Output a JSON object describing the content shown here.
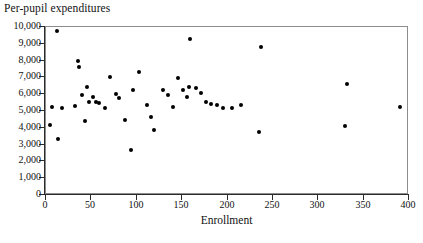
{
  "chart_data": {
    "type": "scatter",
    "title": "Per-pupil expenditures",
    "xlabel": "Enrollment",
    "ylabel": "",
    "xlim": [
      0,
      400
    ],
    "ylim": [
      0,
      10000
    ],
    "xticks": [
      0,
      50,
      100,
      150,
      200,
      250,
      300,
      350,
      400
    ],
    "xtick_labels": [
      "0",
      "50",
      "100",
      "150",
      "200",
      "250",
      "300",
      "350",
      "400"
    ],
    "yticks": [
      0,
      1000,
      2000,
      3000,
      4000,
      5000,
      6000,
      7000,
      8000,
      9000,
      10000
    ],
    "ytick_labels": [
      "0",
      "1,000",
      "2,000",
      "3,000",
      "4,000",
      "5,000",
      "6,000",
      "7,000",
      "8,000",
      "9,000",
      "10,000"
    ],
    "grid": false,
    "legend": null,
    "marker_color": "#000000",
    "marker_shape": "circle",
    "frame_color": "#8d8d8d",
    "background": "#ffffff",
    "n_points": 47,
    "points": [
      {
        "x": 13,
        "y": 9700
      },
      {
        "x": 8,
        "y": 5200
      },
      {
        "x": 6,
        "y": 4100
      },
      {
        "x": 19,
        "y": 5150
      },
      {
        "x": 14,
        "y": 3250
      },
      {
        "x": 36,
        "y": 7900
      },
      {
        "x": 37,
        "y": 7550
      },
      {
        "x": 41,
        "y": 5900
      },
      {
        "x": 33,
        "y": 5250
      },
      {
        "x": 46,
        "y": 6400
      },
      {
        "x": 48,
        "y": 5500
      },
      {
        "x": 44,
        "y": 4350
      },
      {
        "x": 53,
        "y": 5800
      },
      {
        "x": 56,
        "y": 5500
      },
      {
        "x": 60,
        "y": 5400
      },
      {
        "x": 66,
        "y": 5150
      },
      {
        "x": 72,
        "y": 6950
      },
      {
        "x": 78,
        "y": 5950
      },
      {
        "x": 82,
        "y": 5700
      },
      {
        "x": 88,
        "y": 4400
      },
      {
        "x": 95,
        "y": 2600
      },
      {
        "x": 97,
        "y": 6200
      },
      {
        "x": 104,
        "y": 7250
      },
      {
        "x": 112,
        "y": 5300
      },
      {
        "x": 117,
        "y": 4600
      },
      {
        "x": 120,
        "y": 3800
      },
      {
        "x": 130,
        "y": 6200
      },
      {
        "x": 136,
        "y": 5900
      },
      {
        "x": 141,
        "y": 5200
      },
      {
        "x": 147,
        "y": 6900
      },
      {
        "x": 152,
        "y": 6200
      },
      {
        "x": 156,
        "y": 5800
      },
      {
        "x": 160,
        "y": 9250
      },
      {
        "x": 159,
        "y": 6400
      },
      {
        "x": 166,
        "y": 6300
      },
      {
        "x": 172,
        "y": 6000
      },
      {
        "x": 177,
        "y": 5500
      },
      {
        "x": 183,
        "y": 5350
      },
      {
        "x": 190,
        "y": 5300
      },
      {
        "x": 196,
        "y": 5100
      },
      {
        "x": 206,
        "y": 5100
      },
      {
        "x": 216,
        "y": 5300
      },
      {
        "x": 238,
        "y": 8750
      },
      {
        "x": 236,
        "y": 3700
      },
      {
        "x": 333,
        "y": 6550
      },
      {
        "x": 331,
        "y": 4050
      },
      {
        "x": 391,
        "y": 5200
      }
    ]
  }
}
